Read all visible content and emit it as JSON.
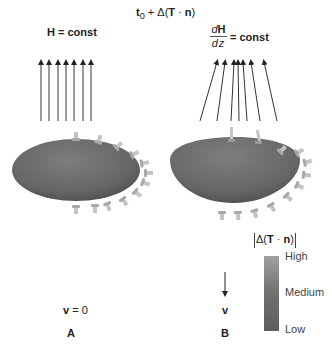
{
  "figure": {
    "title": {
      "base": "t",
      "sub": "0",
      "plus": " + Δ(",
      "T": "T",
      "dot": " · ",
      "n": "n",
      "close": ")"
    },
    "panel_a": {
      "field_label": "H = const",
      "velocity_label_v": "v",
      "velocity_label_rest": " = 0",
      "panel_letter": "A"
    },
    "panel_b": {
      "field_label_num_d": "d",
      "field_label_num_H": "H",
      "field_label_den": "dz",
      "field_label_rest": " = const",
      "velocity_label": "v",
      "panel_letter": "B"
    },
    "colorbar": {
      "title_prefix": "Δ(",
      "title_T": "T",
      "title_dot": " · ",
      "title_n": "n",
      "title_suffix": ")",
      "high": "High",
      "medium": "Medium",
      "low": "Low",
      "colors": {
        "high": "#a0a0a0",
        "medium": "#707070",
        "low": "#5d5d5d"
      }
    },
    "colors": {
      "body": "#6e6e6e",
      "arrow": "#333333",
      "traction_glyph": "#b8b8b8"
    }
  }
}
